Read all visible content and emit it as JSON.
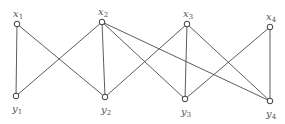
{
  "diagram": {
    "type": "bipartite-graph",
    "colors": {
      "edge": "#4a4a4a",
      "node_stroke": "#3a3a3a",
      "node_fill": "#ffffff",
      "label": "#555555"
    },
    "nodes": [
      {
        "id": "x1",
        "base": "x",
        "sub": "1",
        "x": 17,
        "y": 24,
        "label_pos": "above"
      },
      {
        "id": "x2",
        "base": "x",
        "sub": "2",
        "x": 102,
        "y": 22,
        "label_pos": "above"
      },
      {
        "id": "x3",
        "base": "x",
        "sub": "3",
        "x": 187,
        "y": 24,
        "label_pos": "above"
      },
      {
        "id": "x4",
        "base": "x",
        "sub": "4",
        "x": 270,
        "y": 27,
        "label_pos": "above"
      },
      {
        "id": "y1",
        "base": "y",
        "sub": "1",
        "x": 16,
        "y": 96,
        "label_pos": "below"
      },
      {
        "id": "y2",
        "base": "y",
        "sub": "2",
        "x": 105,
        "y": 97,
        "label_pos": "below"
      },
      {
        "id": "y3",
        "base": "y",
        "sub": "3",
        "x": 185,
        "y": 99,
        "label_pos": "below"
      },
      {
        "id": "y4",
        "base": "y",
        "sub": "4",
        "x": 270,
        "y": 101,
        "label_pos": "below"
      }
    ],
    "edges": [
      [
        "x1",
        "y1"
      ],
      [
        "x1",
        "y2"
      ],
      [
        "x2",
        "y1"
      ],
      [
        "x2",
        "y2"
      ],
      [
        "x2",
        "y3"
      ],
      [
        "x2",
        "y4"
      ],
      [
        "x3",
        "y2"
      ],
      [
        "x3",
        "y3"
      ],
      [
        "x3",
        "y4"
      ],
      [
        "x4",
        "y3"
      ],
      [
        "x4",
        "y4"
      ]
    ]
  }
}
